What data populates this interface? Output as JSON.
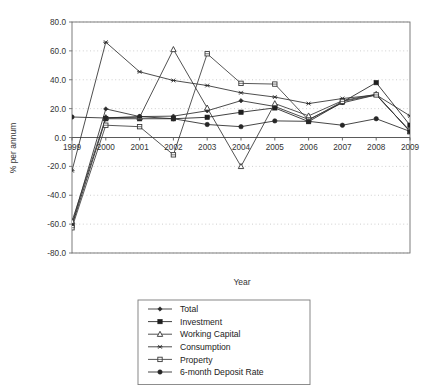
{
  "chart_data": {
    "type": "line",
    "title": "",
    "subtitle": "",
    "xlabel": "Year",
    "ylabel": "% per annum",
    "grid": true,
    "grid_style": "dotted-horizontal",
    "legend_position": "bottom-center",
    "x": [
      "1999",
      "2000",
      "2001",
      "2002",
      "2003",
      "2004",
      "2005",
      "2006",
      "2007",
      "2008",
      "2009"
    ],
    "xtick_labels": [
      "1999",
      "2000",
      "2001",
      "2002",
      "2003",
      "2004",
      "2005",
      "2006",
      "2007",
      "2008",
      "2009"
    ],
    "ytick_labels": [
      "80.0",
      "60.0",
      "40.0",
      "20.0",
      "0.0",
      "-20.0",
      "-40.0",
      "-60.0",
      "-80.0"
    ],
    "ytick_values": [
      80,
      60,
      40,
      20,
      0,
      -20,
      -40,
      -60,
      -80
    ],
    "ylim": [
      -80,
      80
    ],
    "series": [
      {
        "name": "Total",
        "marker": "diamond-small-filled",
        "color": "#2b2b2b",
        "values": [
          -60.0,
          19.8,
          14.5,
          14.8,
          18.5,
          25.5,
          21.5,
          12.5,
          24.0,
          29.5,
          4.5
        ]
      },
      {
        "name": "Investment",
        "marker": "square-filled",
        "color": "#1f1f1f",
        "values": [
          -61.0,
          13.0,
          13.0,
          13.0,
          14.0,
          17.5,
          20.5,
          11.0,
          24.5,
          38.0,
          8.5
        ]
      },
      {
        "name": "Working Capital",
        "marker": "triangle-open",
        "color": "#333333",
        "values": [
          -58.0,
          13.8,
          14.0,
          61.0,
          20.5,
          -20.0,
          23.5,
          15.0,
          25.5,
          30.0,
          4.0
        ]
      },
      {
        "name": "Consumption",
        "marker": "asterisk",
        "color": "#2e2e2e",
        "values": [
          -23.0,
          66.0,
          45.5,
          39.5,
          36.0,
          31.0,
          28.0,
          23.5,
          27.0,
          29.5,
          15.0
        ]
      },
      {
        "name": "Property",
        "marker": "square-open",
        "color": "#3a3a3a",
        "values": [
          -62.5,
          8.5,
          7.5,
          -12.0,
          58.0,
          37.5,
          37.0,
          12.0,
          25.0,
          29.5,
          4.5
        ]
      },
      {
        "name": "6-month Deposit Rate",
        "marker": "circle-filled",
        "color": "#262626",
        "values": [
          14.2,
          13.5,
          14.5,
          13.0,
          9.0,
          7.5,
          11.5,
          11.2,
          8.5,
          13.0,
          4.2
        ]
      }
    ]
  },
  "legend": {
    "items": [
      {
        "label": "Total"
      },
      {
        "label": "Investment"
      },
      {
        "label": "Working Capital"
      },
      {
        "label": "Consumption"
      },
      {
        "label": "Property"
      },
      {
        "label": "6-month Deposit Rate"
      }
    ]
  },
  "axes": {
    "ylabel": "% per annum",
    "xlabel": "Year"
  },
  "colors": {
    "frame": "#6e6e6e",
    "grid": "#c9c9c9",
    "axis_zero": "#5a5a5a",
    "ink": "#2b2b2b",
    "legend_border": "#7a7a7a"
  }
}
